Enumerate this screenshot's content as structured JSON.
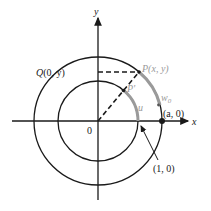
{
  "diagram": {
    "axes": {
      "x_label": "x",
      "y_label": "y",
      "origin_label": "0"
    },
    "points": {
      "P": {
        "name": "P",
        "coords": "(x, y)"
      },
      "P_prime": {
        "name": "P'"
      },
      "Q": {
        "name": "Q",
        "coords": "(0, y)"
      },
      "a0": {
        "text": "(a, 0)"
      },
      "one0": {
        "text": "(1, 0)"
      }
    },
    "arcs": {
      "u": "u",
      "w0": "w",
      "w0_sub": "0"
    },
    "colors": {
      "line": "#1a1a1a",
      "arc_highlight": "#9a9a9a",
      "background": "#ffffff"
    }
  }
}
